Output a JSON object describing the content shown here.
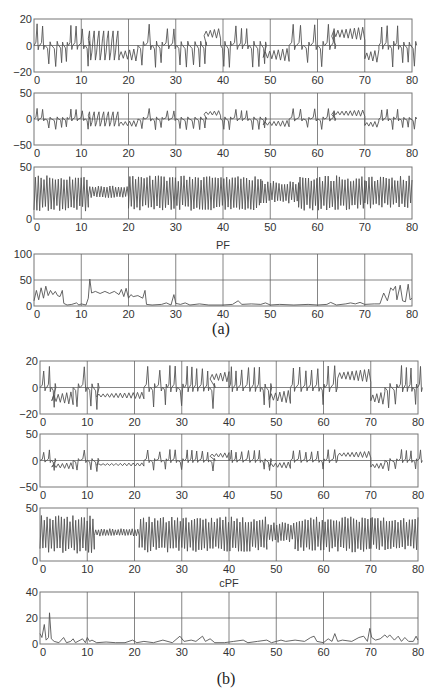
{
  "figure": {
    "captions": [
      "(a)",
      "(b)"
    ],
    "line_color": "#555555",
    "grid_color": "#666666",
    "frame_color": "#777777"
  },
  "chart_data": [
    {
      "panel": "(a)",
      "index": 1,
      "type": "line",
      "title": "",
      "xlabel": "",
      "ylabel": "",
      "xlim": [
        0,
        80
      ],
      "ylim": [
        -20,
        20
      ],
      "xticks": [
        0,
        10,
        20,
        30,
        40,
        50,
        60,
        70,
        80
      ],
      "yticks": [
        -20,
        0,
        20
      ],
      "grid": true,
      "box": {
        "x": 34,
        "y": 19,
        "w": 378,
        "h": 53
      },
      "signal": "lorenz_x",
      "description": "Chaotic Lorenz-like oscillation; spikes ~±17, dual-branch small oscillations at 12–18 (≈+8 and ≈-8), flat-lobe +10 at 36–39, -5 at 49–54, +10 at 63–70, -7 at 70–73",
      "regimes": [
        {
          "from": 0,
          "to": 11.5,
          "kind": "spiky",
          "amp": 16
        },
        {
          "from": 11.5,
          "to": 18,
          "kind": "dual",
          "levels": [
            8,
            -8
          ],
          "amp": 3
        },
        {
          "from": 18,
          "to": 22,
          "kind": "lobe",
          "level": -7,
          "amp": 5
        },
        {
          "from": 22,
          "to": 36,
          "kind": "spiky",
          "amp": 16
        },
        {
          "from": 36,
          "to": 39.5,
          "kind": "lobe",
          "level": 9,
          "amp": 4
        },
        {
          "from": 39.5,
          "to": 48.5,
          "kind": "spiky",
          "amp": 16
        },
        {
          "from": 48.5,
          "to": 54,
          "kind": "lobe",
          "level": -7,
          "amp": 5
        },
        {
          "from": 54,
          "to": 63,
          "kind": "spiky",
          "amp": 16
        },
        {
          "from": 63,
          "to": 70,
          "kind": "lobe",
          "level": 9,
          "amp": 5
        },
        {
          "from": 70,
          "to": 73,
          "kind": "lobe",
          "level": -8,
          "amp": 5
        },
        {
          "from": 73,
          "to": 80,
          "kind": "spiky",
          "amp": 16
        }
      ]
    },
    {
      "panel": "(a)",
      "index": 2,
      "type": "line",
      "title": "",
      "xlim": [
        0,
        80
      ],
      "ylim": [
        -50,
        50
      ],
      "xticks": [
        0,
        10,
        20,
        30,
        40,
        50,
        60,
        70,
        80
      ],
      "yticks": [
        -50,
        0,
        50
      ],
      "grid": true,
      "box": {
        "x": 34,
        "y": 93,
        "w": 378,
        "h": 52
      },
      "signal": "lorenz_y",
      "description": "Same regime structure as x with amplitude ~±22",
      "scale_from": 1,
      "scale": 1.25
    },
    {
      "panel": "(a)",
      "index": 3,
      "type": "line",
      "title": "",
      "xlim": [
        0,
        80
      ],
      "ylim": [
        0,
        50
      ],
      "xticks": [
        0,
        10,
        20,
        30,
        40,
        50,
        60,
        70,
        80
      ],
      "yticks": [
        0,
        50
      ],
      "grid": true,
      "box": {
        "x": 34,
        "y": 167,
        "w": 378,
        "h": 52
      },
      "signal": "lorenz_z",
      "description": "Oscillation between ~8 and ~42, centered ~25; compressed 22–32 band at 12–20",
      "regimes": [
        {
          "from": 0,
          "to": 11.5,
          "center": 25,
          "amp": 15
        },
        {
          "from": 11.5,
          "to": 20,
          "center": 26,
          "amp": 5
        },
        {
          "from": 20,
          "to": 48,
          "center": 25,
          "amp": 14
        },
        {
          "from": 48,
          "to": 56,
          "center": 26,
          "amp": 9
        },
        {
          "from": 56,
          "to": 70,
          "center": 25,
          "amp": 14
        },
        {
          "from": 70,
          "to": 80,
          "center": 26,
          "amp": 13
        }
      ]
    },
    {
      "panel": "(a)",
      "index": 4,
      "type": "line",
      "title": "PF",
      "xlim": [
        0,
        80
      ],
      "ylim": [
        0,
        100
      ],
      "xticks": [
        0,
        10,
        20,
        30,
        40,
        50,
        60,
        70,
        80
      ],
      "yticks": [
        0,
        50,
        100
      ],
      "grid": true,
      "box": {
        "x": 34,
        "y": 254,
        "w": 378,
        "h": 52
      },
      "points": [
        [
          0,
          10
        ],
        [
          0.5,
          30
        ],
        [
          1,
          12
        ],
        [
          1.5,
          35
        ],
        [
          2,
          15
        ],
        [
          2.5,
          38
        ],
        [
          3,
          20
        ],
        [
          3.5,
          30
        ],
        [
          4,
          22
        ],
        [
          4.5,
          28
        ],
        [
          5,
          20
        ],
        [
          5.5,
          18
        ],
        [
          6,
          30
        ],
        [
          6.3,
          5
        ],
        [
          7,
          2
        ],
        [
          8,
          3
        ],
        [
          9,
          6
        ],
        [
          9.5,
          2
        ],
        [
          10,
          4
        ],
        [
          11,
          2
        ],
        [
          11.5,
          15
        ],
        [
          11.8,
          52
        ],
        [
          12.2,
          25
        ],
        [
          13,
          28
        ],
        [
          14,
          24
        ],
        [
          15,
          28
        ],
        [
          16,
          24
        ],
        [
          17,
          28
        ],
        [
          18,
          22
        ],
        [
          18.5,
          32
        ],
        [
          19,
          18
        ],
        [
          19.5,
          34
        ],
        [
          20,
          15
        ],
        [
          20.5,
          22
        ],
        [
          21,
          18
        ],
        [
          22,
          20
        ],
        [
          23,
          15
        ],
        [
          23.5,
          30
        ],
        [
          23.8,
          3
        ],
        [
          25,
          2
        ],
        [
          27,
          3
        ],
        [
          28,
          6
        ],
        [
          29,
          2
        ],
        [
          29.6,
          22
        ],
        [
          30,
          5
        ],
        [
          31,
          3
        ],
        [
          32,
          6
        ],
        [
          33,
          2
        ],
        [
          35,
          4
        ],
        [
          37,
          2
        ],
        [
          40,
          2
        ],
        [
          42,
          3
        ],
        [
          43.2,
          10
        ],
        [
          44,
          3
        ],
        [
          46,
          4
        ],
        [
          48,
          3
        ],
        [
          49,
          6
        ],
        [
          50,
          2
        ],
        [
          52,
          3
        ],
        [
          55,
          2
        ],
        [
          58,
          3
        ],
        [
          60,
          2
        ],
        [
          62,
          3
        ],
        [
          62.8,
          7
        ],
        [
          64,
          2
        ],
        [
          66,
          4
        ],
        [
          67,
          6
        ],
        [
          68,
          4
        ],
        [
          69,
          7
        ],
        [
          70,
          3
        ],
        [
          72,
          4
        ],
        [
          73.2,
          4
        ],
        [
          74,
          25
        ],
        [
          74.8,
          10
        ],
        [
          75.5,
          35
        ],
        [
          76,
          30
        ],
        [
          76.5,
          38
        ],
        [
          76.8,
          12
        ],
        [
          77.5,
          40
        ],
        [
          78,
          10
        ],
        [
          78.6,
          8
        ],
        [
          79.2,
          42
        ],
        [
          79.6,
          12
        ],
        [
          80,
          15
        ]
      ]
    },
    {
      "panel": "(b)",
      "index": 1,
      "type": "line",
      "title": "",
      "xlim": [
        0,
        80
      ],
      "ylim": [
        -20,
        20
      ],
      "xticks": [
        0,
        10,
        20,
        30,
        40,
        50,
        60,
        70,
        80
      ],
      "yticks": [
        -20,
        0,
        20
      ],
      "grid": true,
      "box": {
        "x": 40,
        "y": 361,
        "w": 378,
        "h": 53
      },
      "signal": "lorenz_x_filtered",
      "description": "Single clean trajectory: spikes ±17, negative lobe -8 at 2–7, long damped -7 oscillation 12–22, +9 lobe 36–40, -7 lobe 49–53, +10 lobe 63–70, -8 lobe 70–73",
      "regimes": [
        {
          "from": 0,
          "to": 2.5,
          "kind": "spiky",
          "amp": 16
        },
        {
          "from": 2.5,
          "to": 7,
          "kind": "lobe",
          "level": -8,
          "amp": 5
        },
        {
          "from": 7,
          "to": 12,
          "kind": "spiky",
          "amp": 16
        },
        {
          "from": 12,
          "to": 22,
          "kind": "lobe",
          "level": -6,
          "amp": 2.5
        },
        {
          "from": 22,
          "to": 36,
          "kind": "spiky",
          "amp": 16
        },
        {
          "from": 36,
          "to": 40,
          "kind": "lobe",
          "level": 8,
          "amp": 4
        },
        {
          "from": 40,
          "to": 48.5,
          "kind": "spiky",
          "amp": 16
        },
        {
          "from": 48.5,
          "to": 53,
          "kind": "lobe",
          "level": -7,
          "amp": 5
        },
        {
          "from": 53,
          "to": 63,
          "kind": "spiky",
          "amp": 16
        },
        {
          "from": 63,
          "to": 70,
          "kind": "lobe",
          "level": 9,
          "amp": 5
        },
        {
          "from": 70,
          "to": 73,
          "kind": "lobe",
          "level": -8,
          "amp": 5
        },
        {
          "from": 73,
          "to": 80,
          "kind": "spiky",
          "amp": 16
        }
      ]
    },
    {
      "panel": "(b)",
      "index": 2,
      "type": "line",
      "title": "",
      "xlim": [
        0,
        80
      ],
      "ylim": [
        -50,
        50
      ],
      "xticks": [
        0,
        10,
        20,
        30,
        40,
        50,
        60,
        70,
        80
      ],
      "yticks": [
        -50,
        0,
        50
      ],
      "grid": true,
      "box": {
        "x": 40,
        "y": 434,
        "w": 378,
        "h": 53
      },
      "signal": "lorenz_y_filtered",
      "scale_from": 5,
      "scale": 1.25
    },
    {
      "panel": "(b)",
      "index": 3,
      "type": "line",
      "title": "",
      "xlim": [
        0,
        80
      ],
      "ylim": [
        0,
        50
      ],
      "xticks": [
        0,
        10,
        20,
        30,
        40,
        50,
        60,
        70,
        80
      ],
      "yticks": [
        0,
        50
      ],
      "grid": true,
      "box": {
        "x": 40,
        "y": 508,
        "w": 378,
        "h": 53
      },
      "signal": "lorenz_z_filtered",
      "regimes": [
        {
          "from": 0,
          "to": 11.5,
          "center": 25,
          "amp": 15
        },
        {
          "from": 11.5,
          "to": 21,
          "center": 27,
          "amp": 3
        },
        {
          "from": 21,
          "to": 48,
          "center": 25,
          "amp": 14
        },
        {
          "from": 48,
          "to": 54,
          "center": 27,
          "amp": 8
        },
        {
          "from": 54,
          "to": 70,
          "center": 25,
          "amp": 14
        },
        {
          "from": 70,
          "to": 80,
          "center": 26,
          "amp": 13
        }
      ]
    },
    {
      "panel": "(b)",
      "index": 4,
      "type": "line",
      "title": "cPF",
      "xlim": [
        0,
        80
      ],
      "ylim": [
        0,
        40
      ],
      "xticks": [
        0,
        10,
        20,
        30,
        40,
        50,
        60,
        70,
        80
      ],
      "yticks": [
        0,
        20,
        40
      ],
      "grid": true,
      "box": {
        "x": 40,
        "y": 592,
        "w": 378,
        "h": 52
      },
      "points": [
        [
          0,
          8
        ],
        [
          0.4,
          5
        ],
        [
          0.9,
          15
        ],
        [
          1.3,
          3
        ],
        [
          1.8,
          5
        ],
        [
          2,
          24
        ],
        [
          2.4,
          4
        ],
        [
          3,
          2
        ],
        [
          4,
          1
        ],
        [
          5,
          5
        ],
        [
          5.6,
          1
        ],
        [
          6.5,
          2
        ],
        [
          7,
          4
        ],
        [
          7.5,
          1
        ],
        [
          8.5,
          3
        ],
        [
          9,
          4
        ],
        [
          9.6,
          1
        ],
        [
          10,
          5
        ],
        [
          10.5,
          2
        ],
        [
          11,
          3
        ],
        [
          12,
          1
        ],
        [
          14,
          1.5
        ],
        [
          16,
          1
        ],
        [
          18,
          1
        ],
        [
          19.6,
          3
        ],
        [
          20.5,
          1
        ],
        [
          22,
          2
        ],
        [
          24,
          1
        ],
        [
          26,
          3
        ],
        [
          28,
          1
        ],
        [
          29.6,
          6
        ],
        [
          30.5,
          2
        ],
        [
          32,
          3
        ],
        [
          33,
          2
        ],
        [
          34.4,
          6
        ],
        [
          35,
          2
        ],
        [
          36,
          4
        ],
        [
          37,
          1
        ],
        [
          39,
          1
        ],
        [
          41,
          2
        ],
        [
          43,
          3
        ],
        [
          44,
          1
        ],
        [
          46,
          2
        ],
        [
          48,
          3
        ],
        [
          49,
          1
        ],
        [
          51,
          3
        ],
        [
          52,
          2
        ],
        [
          54,
          3
        ],
        [
          56,
          2
        ],
        [
          57.3,
          5
        ],
        [
          58,
          6
        ],
        [
          58.6,
          2
        ],
        [
          60,
          1
        ],
        [
          61,
          4
        ],
        [
          61.8,
          2
        ],
        [
          62.4,
          8
        ],
        [
          63,
          2
        ],
        [
          64,
          3
        ],
        [
          66,
          2
        ],
        [
          67.5,
          5
        ],
        [
          68.5,
          6
        ],
        [
          69.3,
          2
        ],
        [
          69.8,
          12
        ],
        [
          70.2,
          5
        ],
        [
          71,
          3
        ],
        [
          72,
          4
        ],
        [
          73,
          7
        ],
        [
          73.5,
          5
        ],
        [
          74,
          7
        ],
        [
          75,
          3
        ],
        [
          75.8,
          6
        ],
        [
          76.5,
          2
        ],
        [
          77.2,
          5
        ],
        [
          78,
          2
        ],
        [
          79,
          2
        ],
        [
          79.6,
          6
        ],
        [
          80,
          3
        ]
      ]
    }
  ]
}
